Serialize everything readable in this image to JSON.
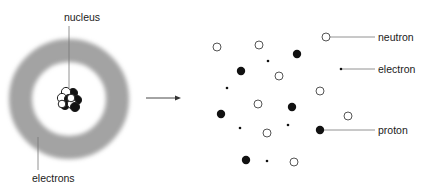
{
  "labels": {
    "nucleus": "nucleus",
    "electrons": "electrons",
    "neutron": "neutron",
    "electron": "electron",
    "proton": "proton"
  },
  "colors": {
    "ring": "#a3a3a3",
    "particle_fill": "#111111",
    "particle_stroke": "#555555",
    "line": "#777777"
  },
  "atom": {
    "center": [
      69,
      99
    ],
    "ring_outer_radius": 60,
    "ring_inner_radius": 37
  },
  "legend": [
    {
      "type": "neutron",
      "label": "neutron"
    },
    {
      "type": "electron",
      "label": "electron"
    },
    {
      "type": "proton",
      "label": "proton"
    }
  ],
  "free_particles": [
    {
      "type": "neutron",
      "x": 217,
      "y": 47
    },
    {
      "type": "neutron",
      "x": 259,
      "y": 45
    },
    {
      "type": "proton",
      "x": 297,
      "y": 54
    },
    {
      "type": "electron",
      "x": 268,
      "y": 61
    },
    {
      "type": "proton",
      "x": 241,
      "y": 71
    },
    {
      "type": "neutron",
      "x": 279,
      "y": 76
    },
    {
      "type": "electron",
      "x": 227,
      "y": 88
    },
    {
      "type": "neutron",
      "x": 320,
      "y": 91
    },
    {
      "type": "neutron",
      "x": 258,
      "y": 104
    },
    {
      "type": "proton",
      "x": 292,
      "y": 107
    },
    {
      "type": "proton",
      "x": 221,
      "y": 114
    },
    {
      "type": "neutron",
      "x": 348,
      "y": 116
    },
    {
      "type": "electron",
      "x": 288,
      "y": 125
    },
    {
      "type": "electron",
      "x": 240,
      "y": 128
    },
    {
      "type": "neutron",
      "x": 267,
      "y": 133
    },
    {
      "type": "proton",
      "x": 246,
      "y": 160
    },
    {
      "type": "electron",
      "x": 267,
      "y": 161
    },
    {
      "type": "neutron",
      "x": 294,
      "y": 162
    }
  ]
}
